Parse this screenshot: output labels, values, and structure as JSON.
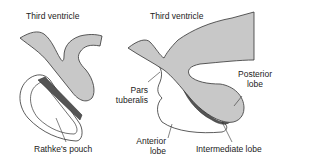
{
  "diagram": {
    "colors": {
      "neural_tissue": "#c8c8c8",
      "intermediate_lobe": "#555555",
      "outline": "#333333",
      "background": "#ffffff"
    },
    "left_panel": {
      "labels": {
        "third_ventricle": "Third ventricle",
        "rathkes_pouch": "Rathke's pouch"
      }
    },
    "right_panel": {
      "labels": {
        "third_ventricle": "Third ventricle",
        "pars_tuberalis_1": "Pars",
        "pars_tuberalis_2": "tuberalis",
        "posterior_lobe_1": "Posterior",
        "posterior_lobe_2": "lobe",
        "anterior_lobe_1": "Anterior",
        "anterior_lobe_2": "lobe",
        "intermediate_lobe": "Intermediate lobe"
      }
    }
  }
}
